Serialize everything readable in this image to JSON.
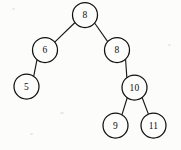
{
  "diagram": {
    "kind": "binary-search-tree",
    "background_color": "#fcfcfa",
    "stroke_color": "#111111",
    "node_fill_color": "#fdfdfb",
    "node_radius": 12.5,
    "nodes": [
      {
        "id": "n0",
        "label": "8",
        "cx": 85,
        "cy": 15,
        "role": "root"
      },
      {
        "id": "n1",
        "label": "6",
        "cx": 45,
        "cy": 50,
        "role": "left-child"
      },
      {
        "id": "n2",
        "label": "8",
        "cx": 117,
        "cy": 50,
        "role": "right-child"
      },
      {
        "id": "n3",
        "label": "5",
        "cx": 26.5,
        "cy": 86.5,
        "role": "leaf"
      },
      {
        "id": "n4",
        "label": "10",
        "cx": 134.5,
        "cy": 87.5,
        "role": "internal"
      },
      {
        "id": "n5",
        "label": "9",
        "cx": 115.5,
        "cy": 125.5,
        "role": "leaf"
      },
      {
        "id": "n6",
        "label": "11",
        "cx": 153.5,
        "cy": 125.5,
        "role": "leaf"
      }
    ],
    "edges": [
      {
        "id": "e0",
        "from": "n0",
        "to": "n1",
        "x1": 75.0,
        "y1": 22.5,
        "x2": 54.2,
        "y2": 42.6
      },
      {
        "id": "e1",
        "from": "n0",
        "to": "n2",
        "x1": 94.6,
        "y1": 23.0,
        "x2": 108.2,
        "y2": 42.3
      },
      {
        "id": "e2",
        "from": "n1",
        "to": "n3",
        "x1": 37.0,
        "y1": 59.7,
        "x2": 33.8,
        "y2": 75.8
      },
      {
        "id": "e3",
        "from": "n2",
        "to": "n4",
        "x1": 125.6,
        "y1": 59.5,
        "x2": 126.9,
        "y2": 78.4
      },
      {
        "id": "e4",
        "from": "n4",
        "to": "n5",
        "x1": 127.3,
        "y1": 97.5,
        "x2": 122.0,
        "y2": 114.7
      },
      {
        "id": "e5",
        "from": "n4",
        "to": "n6",
        "x1": 142.0,
        "y1": 97.3,
        "x2": 148.6,
        "y2": 114.6
      }
    ]
  }
}
